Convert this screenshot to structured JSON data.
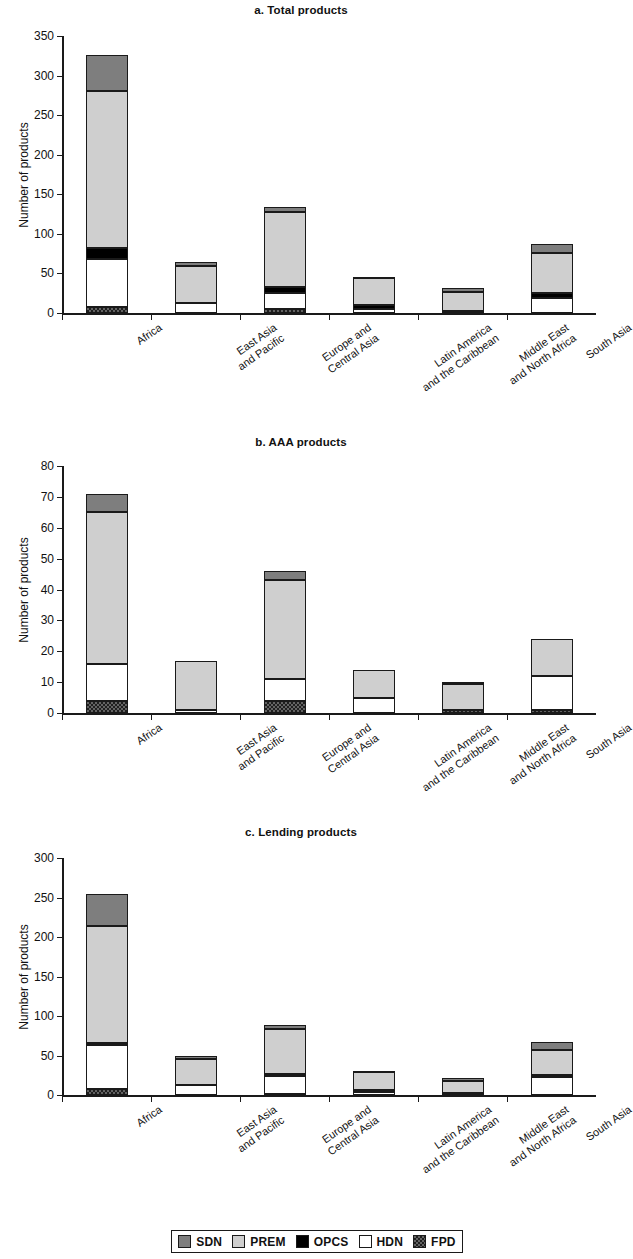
{
  "figure": {
    "ylabel": "Number of products",
    "categories": [
      "Africa",
      "East Asia\nand Pacific",
      "Europe and\nCentral Asia",
      "Latin America\nand the Caribbean",
      "Middle East\nand North Africa",
      "South Asia"
    ],
    "series_order_bottom_to_top": [
      "FPD",
      "HDN",
      "OPCS",
      "PREM",
      "SDN"
    ],
    "colors": {
      "SDN": "#7e7e7e",
      "PREM": "#cfcfcf",
      "OPCS": "#000000",
      "HDN": "#ffffff",
      "FPD": "#636363"
    }
  },
  "legend": {
    "items": [
      {
        "label": "SDN",
        "key": "SDN"
      },
      {
        "label": "PREM",
        "key": "PREM"
      },
      {
        "label": "OPCS",
        "key": "OPCS"
      },
      {
        "label": "HDN",
        "key": "HDN"
      },
      {
        "label": "FPD",
        "key": "FPD"
      }
    ]
  },
  "chart_data": [
    {
      "type": "bar",
      "stacked": true,
      "panel": "a",
      "title": "a. Total products",
      "xlabel": "",
      "ylabel": "Number of products",
      "ylim": [
        0,
        350
      ],
      "yticks": [
        0,
        50,
        100,
        150,
        200,
        250,
        300,
        350
      ],
      "grid": false,
      "legend_position": "below figure",
      "categories": [
        "Africa",
        "East Asia and Pacific",
        "Europe and Central Asia",
        "Latin America and the Caribbean",
        "Middle East and North Africa",
        "South Asia"
      ],
      "series": [
        {
          "name": "FPD",
          "values": [
            8,
            0,
            5,
            0,
            1,
            0
          ]
        },
        {
          "name": "HDN",
          "values": [
            60,
            13,
            20,
            5,
            0,
            19
          ]
        },
        {
          "name": "OPCS",
          "values": [
            14,
            0,
            8,
            5,
            2,
            6
          ]
        },
        {
          "name": "PREM",
          "values": [
            198,
            47,
            95,
            34,
            24,
            51
          ]
        },
        {
          "name": "SDN",
          "values": [
            46,
            5,
            6,
            1,
            4,
            11
          ]
        }
      ],
      "totals": [
        326,
        65,
        134,
        45,
        31,
        87
      ]
    },
    {
      "type": "bar",
      "stacked": true,
      "panel": "b",
      "title": "b. AAA products",
      "xlabel": "",
      "ylabel": "Number of products",
      "ylim": [
        0,
        80
      ],
      "yticks": [
        0,
        10,
        20,
        30,
        40,
        50,
        60,
        70,
        80
      ],
      "grid": false,
      "legend_position": "below figure",
      "categories": [
        "Africa",
        "East Asia and Pacific",
        "Europe and Central Asia",
        "Latin America and the Caribbean",
        "Middle East and North Africa",
        "South Asia"
      ],
      "series": [
        {
          "name": "FPD",
          "values": [
            4,
            0,
            4,
            0,
            1,
            1
          ]
        },
        {
          "name": "HDN",
          "values": [
            12,
            1,
            7,
            5,
            0,
            11
          ]
        },
        {
          "name": "OPCS",
          "values": [
            0,
            0,
            0,
            0,
            0,
            0
          ]
        },
        {
          "name": "PREM",
          "values": [
            49,
            16,
            32,
            9,
            8.5,
            12
          ]
        },
        {
          "name": "SDN",
          "values": [
            6,
            0,
            3,
            0,
            0.5,
            0
          ]
        }
      ],
      "totals": [
        71,
        17,
        46,
        14,
        10,
        24
      ]
    },
    {
      "type": "bar",
      "stacked": true,
      "panel": "c",
      "title": "c. Lending products",
      "xlabel": "",
      "ylabel": "Number of products",
      "ylim": [
        0,
        300
      ],
      "yticks": [
        0,
        50,
        100,
        150,
        200,
        250,
        300
      ],
      "grid": false,
      "legend_position": "below figure",
      "categories": [
        "Africa",
        "East Asia and Pacific",
        "Europe and Central Asia",
        "Latin America and the Caribbean",
        "Middle East and North Africa",
        "South Asia"
      ],
      "series": [
        {
          "name": "FPD",
          "values": [
            7,
            0,
            1,
            0,
            0,
            0
          ]
        },
        {
          "name": "HDN",
          "values": [
            56,
            13,
            23,
            4,
            0,
            23
          ]
        },
        {
          "name": "OPCS",
          "values": [
            3,
            0,
            2,
            2,
            2,
            2
          ]
        },
        {
          "name": "PREM",
          "values": [
            148,
            33,
            58,
            24,
            16,
            32
          ]
        },
        {
          "name": "SDN",
          "values": [
            41,
            3,
            5,
            1,
            3,
            10
          ]
        }
      ],
      "totals": [
        255,
        49,
        89,
        31,
        21,
        67
      ]
    }
  ]
}
